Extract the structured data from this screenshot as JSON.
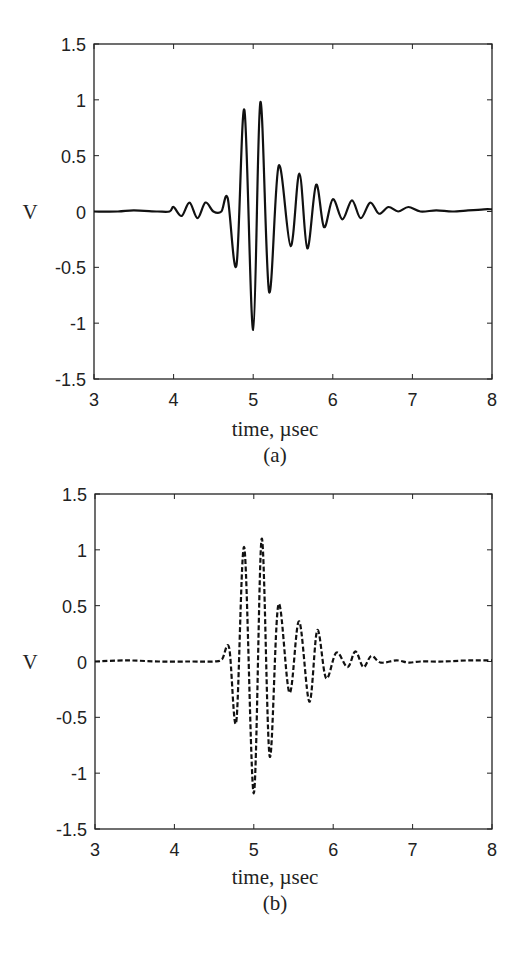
{
  "chart_data": [
    {
      "type": "line",
      "panel_label": "(a)",
      "title": "",
      "xlabel": "time, µsec",
      "ylabel": "V",
      "xlim": [
        3,
        8
      ],
      "ylim": [
        -1.5,
        1.5
      ],
      "xticks": [
        3,
        4,
        5,
        6,
        7,
        8
      ],
      "yticks": [
        1.5,
        1,
        0.5,
        0,
        -0.5,
        -1,
        -1.5
      ],
      "ytick_labels": [
        "1.5",
        "1",
        "0.5",
        "0",
        "-0.5",
        "-1",
        "-1.5"
      ],
      "xtick_labels": [
        "3",
        "4",
        "5",
        "6",
        "7",
        "8"
      ],
      "grid": false,
      "line_style": "solid",
      "series": [
        {
          "name": "measured signal",
          "x": [
            3.0,
            3.3,
            3.5,
            3.8,
            3.95,
            4.0,
            4.1,
            4.2,
            4.3,
            4.4,
            4.5,
            4.6,
            4.68,
            4.79,
            4.89,
            5.0,
            5.09,
            5.2,
            5.32,
            5.47,
            5.58,
            5.68,
            5.79,
            5.89,
            6.0,
            6.12,
            6.24,
            6.35,
            6.47,
            6.58,
            6.7,
            6.82,
            6.95,
            7.1,
            7.3,
            7.5,
            7.7,
            7.9,
            8.0
          ],
          "y": [
            0.0,
            0.0,
            0.01,
            0.0,
            0.0,
            0.04,
            -0.04,
            0.08,
            -0.06,
            0.08,
            0.0,
            0.0,
            0.12,
            -0.48,
            0.91,
            -1.06,
            0.98,
            -0.72,
            0.41,
            -0.31,
            0.34,
            -0.33,
            0.24,
            -0.14,
            0.11,
            -0.07,
            0.1,
            -0.06,
            0.08,
            -0.02,
            0.04,
            0.0,
            0.04,
            0.0,
            0.01,
            0.0,
            0.01,
            0.02,
            0.02
          ]
        }
      ]
    },
    {
      "type": "line",
      "panel_label": "(b)",
      "title": "",
      "xlabel": "time, µsec",
      "ylabel": "V",
      "xlim": [
        3,
        8
      ],
      "ylim": [
        -1.5,
        1.5
      ],
      "xticks": [
        3,
        4,
        5,
        6,
        7,
        8
      ],
      "yticks": [
        1.5,
        1,
        0.5,
        0,
        -0.5,
        -1,
        -1.5
      ],
      "ytick_labels": [
        "1.5",
        "1",
        "0.5",
        "0",
        "-0.5",
        "-1",
        "-1.5"
      ],
      "xtick_labels": [
        "3",
        "4",
        "5",
        "6",
        "7",
        "8"
      ],
      "grid": false,
      "line_style": "dashed",
      "series": [
        {
          "name": "simulated signal",
          "x": [
            3.0,
            3.4,
            3.8,
            4.2,
            4.5,
            4.6,
            4.69,
            4.78,
            4.88,
            5.0,
            5.1,
            5.2,
            5.31,
            5.45,
            5.57,
            5.7,
            5.8,
            5.91,
            6.04,
            6.18,
            6.28,
            6.38,
            6.48,
            6.6,
            6.8,
            6.95,
            7.1,
            7.4,
            7.7,
            8.0
          ],
          "y": [
            0.0,
            0.01,
            0.0,
            0.0,
            0.0,
            0.02,
            0.12,
            -0.54,
            1.02,
            -1.18,
            1.1,
            -0.85,
            0.51,
            -0.28,
            0.36,
            -0.36,
            0.28,
            -0.15,
            0.08,
            -0.05,
            0.09,
            -0.05,
            0.05,
            -0.01,
            0.01,
            -0.01,
            0.0,
            0.0,
            0.01,
            0.01
          ]
        }
      ]
    }
  ]
}
